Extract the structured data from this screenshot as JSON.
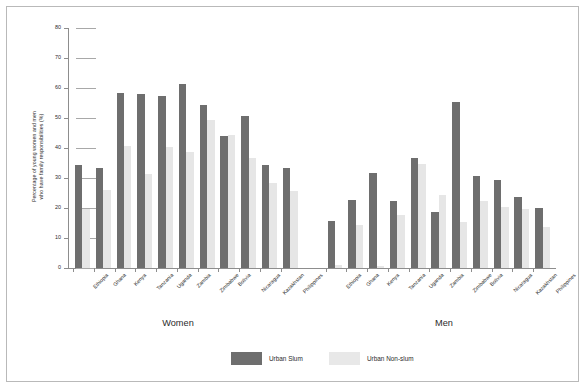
{
  "chart_data": {
    "type": "bar",
    "title": "",
    "subtitle": "",
    "xlabel": "",
    "ylabel": "Percentage of young women and men\nwho have family responsibilities (%)",
    "ylim": [
      0,
      80
    ],
    "yticks": [
      0,
      10,
      20,
      30,
      40,
      50,
      60,
      70,
      80
    ],
    "grid": "short right ticks at each y tick",
    "legend_position": "bottom-center",
    "groups": [
      {
        "name": "Women",
        "label": "Women"
      },
      {
        "name": "Men",
        "label": "Men"
      }
    ],
    "categories": [
      "Ethiopia",
      "Ghana",
      "Kenya",
      "Tanzania",
      "Uganda",
      "Zambia",
      "Zimbabwe",
      "Bolivia",
      "Nicaragua",
      "Kazakhstan",
      "Philippines",
      "Ethiopia",
      "Ghana",
      "Kenya",
      "Tanzania",
      "Uganda",
      "Zambia",
      "Zimbabwe",
      "Bolivia",
      "Nicaragua",
      "Kazakhstan",
      "Philippines"
    ],
    "series": [
      {
        "name": "Urban Slum",
        "color": "#6e6e6e",
        "values": [
          34.5,
          33.4,
          58.2,
          58.0,
          57.3,
          61.5,
          54.3,
          44.0,
          50.6,
          34.3,
          33.4,
          15.6,
          22.6,
          31.6,
          22.4,
          36.7,
          18.8,
          55.5,
          30.8,
          29.2,
          23.8,
          20.0
        ]
      },
      {
        "name": "Urban Non-slum",
        "color": "#e6e6e6",
        "values": [
          19.8,
          26.0,
          40.8,
          31.3,
          40.2,
          38.8,
          49.5,
          44.3,
          36.7,
          28.3,
          25.6,
          1.0,
          14.5,
          0.8,
          17.7,
          34.8,
          24.5,
          15.5,
          22.3,
          20.2,
          19.7,
          13.8
        ]
      }
    ],
    "legend": [
      {
        "label": "Urban Slum",
        "color": "#6e6e6e"
      },
      {
        "label": "Urban Non-slum",
        "color": "#e8e8e8"
      }
    ]
  }
}
